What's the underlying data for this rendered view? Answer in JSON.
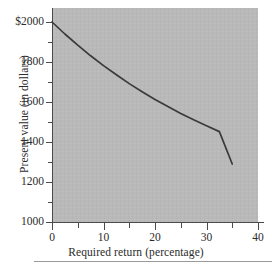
{
  "chart_data": {
    "type": "line",
    "title": "",
    "xlabel": "Required return (percentage)",
    "ylabel": "Present value (in dollars)",
    "xlim": [
      0,
      40
    ],
    "ylim": [
      1000,
      2070
    ],
    "grid": false,
    "legend": null,
    "background_color": "#b9b9b9",
    "line_color": "#3a3a3a",
    "x_ticks": [
      0,
      10,
      20,
      30,
      40
    ],
    "x_tick_labels": [
      "0",
      "10",
      "20",
      "30",
      "40"
    ],
    "x_minor_ticks": [
      5,
      15,
      25,
      35
    ],
    "y_ticks": [
      1000,
      1200,
      1400,
      1600,
      1800,
      2000
    ],
    "y_tick_labels": [
      "1000",
      "1200",
      "1400",
      "1600",
      "1800",
      "$2000"
    ],
    "y_minor_ticks": [
      1100,
      1300,
      1500,
      1700,
      1900
    ],
    "series": [
      {
        "name": "Present value",
        "x": [
          0,
          2.5,
          5,
          7.5,
          10,
          12.5,
          15,
          17.5,
          20,
          22.5,
          25,
          27.5,
          30,
          32.5,
          35
        ],
        "values": [
          2000,
          1940,
          1884,
          1831,
          1782,
          1736,
          1692,
          1651,
          1613,
          1577,
          1543,
          1511,
          1481,
          1452,
          1290
        ]
      }
    ],
    "annotations": []
  },
  "axis": {
    "x_title": "Required return (percentage)",
    "y_title": "Present value (in dollars)",
    "x_tick_labels": [
      "0",
      "10",
      "20",
      "30",
      "40"
    ],
    "y_tick_labels": [
      "1000",
      "1200",
      "1400",
      "1600",
      "1800",
      "$2000"
    ]
  }
}
